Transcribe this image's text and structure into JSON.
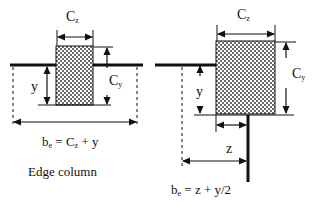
{
  "diagrams": [
    {
      "id": "edge",
      "labels": {
        "cz_main": "C",
        "cz_sub": "z",
        "cy_main": "C",
        "cy_sub": "y",
        "y": "y",
        "formula_pre": "b",
        "formula_sub": "e",
        "formula_post": " = C",
        "formula_sub2": "z",
        "formula_end": " + y",
        "caption": "Edge column"
      }
    },
    {
      "id": "corner",
      "labels": {
        "cz_main": "C",
        "cz_sub": "z",
        "cy_main": "C",
        "cy_sub": "y",
        "y": "y",
        "z": "z",
        "formula_pre": "b",
        "formula_sub": "e",
        "formula_post": " = z + y/2"
      }
    }
  ],
  "colors": {
    "line": "#111111",
    "hatch_bg": "#ffffff",
    "hatch_dot": "#1a1a1a"
  }
}
